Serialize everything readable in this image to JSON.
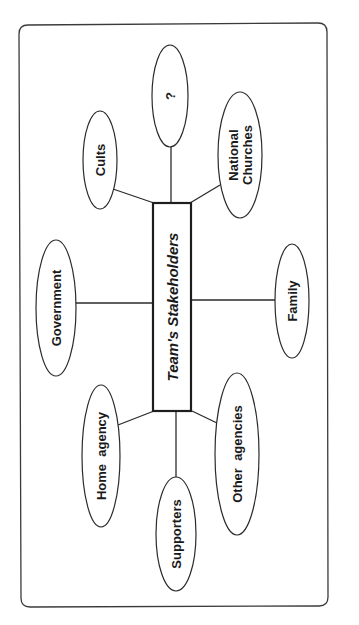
{
  "diagram": {
    "center": {
      "id": "center",
      "label": "Team's Stakeholders"
    },
    "nodes": [
      {
        "id": "cults",
        "lines": [
          "Cults"
        ]
      },
      {
        "id": "unknown",
        "lines": [
          "?"
        ]
      },
      {
        "id": "national-churches",
        "lines": [
          "National",
          "Churches"
        ]
      },
      {
        "id": "government",
        "lines": [
          "Government"
        ]
      },
      {
        "id": "family",
        "lines": [
          "Family"
        ]
      },
      {
        "id": "home-agency",
        "lines": [
          "Home  agency"
        ]
      },
      {
        "id": "supporters",
        "lines": [
          "Supporters"
        ]
      },
      {
        "id": "other-agencies",
        "lines": [
          "Other  agencies"
        ]
      }
    ],
    "edges": [
      {
        "from": "center",
        "to": "cults"
      },
      {
        "from": "center",
        "to": "unknown"
      },
      {
        "from": "center",
        "to": "national-churches"
      },
      {
        "from": "center",
        "to": "government"
      },
      {
        "from": "center",
        "to": "family"
      },
      {
        "from": "center",
        "to": "home-agency"
      },
      {
        "from": "center",
        "to": "supporters"
      },
      {
        "from": "center",
        "to": "other-agencies"
      }
    ],
    "orientation": "rotated-90-counterclockwise"
  }
}
